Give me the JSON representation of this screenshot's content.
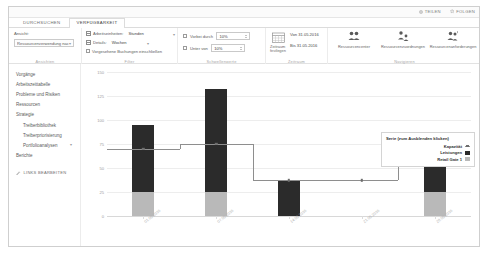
{
  "top_bar": {
    "actions": [
      {
        "label": "TEILEN",
        "icon": "share-icon"
      },
      {
        "label": "FOLGEN",
        "icon": "star-icon"
      }
    ]
  },
  "ribbon": {
    "tabs": [
      {
        "label": "DURCHSUCHEN",
        "active": false
      },
      {
        "label": "VERFÜGBARKEIT",
        "active": true
      }
    ],
    "groups": {
      "ansichten": {
        "label": "Ansichten",
        "field_label": "Ansicht:",
        "view_value": "Ressourcenverwendung nac",
        "caret": "▾"
      },
      "filter": {
        "label": "Filter",
        "rows": [
          {
            "icon": "units-grid-icon",
            "label": "Arbeitseinheiten:",
            "value": "Stunden",
            "caret": "▾"
          },
          {
            "icon": "details-grid-icon",
            "label": "Details:",
            "value": "Wochen",
            "caret": "▾"
          },
          {
            "icon": "checkbox",
            "label": "Vorgesehene Buchungen einschließen",
            "value": "",
            "caret": ""
          }
        ]
      },
      "schwellenwerte": {
        "label": "Schwellenwerte",
        "rows": [
          {
            "checkbox": true,
            "label": "Vorbei durch",
            "value": "10%"
          },
          {
            "checkbox": true,
            "label": "Unter von",
            "value": "10%"
          }
        ]
      },
      "zeitraum": {
        "label": "Zeitraum",
        "button_label": "Zeitraum festlegen",
        "date_from": "Von 31.05.2016",
        "date_to": "Bis 31.05.2016",
        "icon": "calendar-icon"
      },
      "navigieren": {
        "label": "Navigieren",
        "buttons": [
          {
            "label": "Ressourcencenter",
            "icon": "people-icon"
          },
          {
            "label": "Ressourcenzuordnungen",
            "icon": "people-assign-icon"
          },
          {
            "label": "Ressourcenanforderungen",
            "icon": "people-request-icon"
          }
        ]
      }
    }
  },
  "sidebar": {
    "items": [
      {
        "label": "Vorgänge",
        "sub": false,
        "caret": ""
      },
      {
        "label": "Arbeitszeittabelle",
        "sub": false,
        "caret": ""
      },
      {
        "label": "Probleme und Risiken",
        "sub": false,
        "caret": ""
      },
      {
        "label": "Ressourcen",
        "sub": false,
        "caret": ""
      },
      {
        "label": "Strategie",
        "sub": false,
        "caret": ""
      },
      {
        "label": "Treiberbibliothek",
        "sub": true,
        "caret": ""
      },
      {
        "label": "Treiberpriorisierung",
        "sub": true,
        "caret": ""
      },
      {
        "label": "Portfolioanalysen",
        "sub": true,
        "caret": "▾"
      },
      {
        "label": "Berichte",
        "sub": false,
        "caret": ""
      }
    ],
    "edit_links": {
      "label": "LINKS BEARBEITEN",
      "icon": "pencil-icon"
    }
  },
  "legend": {
    "title": "Serie (zum Ausblenden klicken)",
    "entries": [
      {
        "label": "Kapazität",
        "type": "line",
        "color": "#8e8e8e"
      },
      {
        "label": "Leistungen",
        "type": "area",
        "color": "#2b2b2b"
      },
      {
        "label": "Retail Gate 1",
        "type": "area",
        "color": "#b9b9b9"
      }
    ]
  },
  "chart_data": {
    "type": "bar",
    "stacked": true,
    "title": "",
    "xlabel": "",
    "ylabel": "",
    "ylim": [
      0,
      150
    ],
    "yticks": [
      0,
      25,
      50,
      75,
      100,
      125,
      150
    ],
    "grid": true,
    "legend_position": "right",
    "categories": [
      "01.05.2016",
      "07.05.2016",
      "14.05.2016",
      "21.05.2016",
      "28.05.2016"
    ],
    "series": [
      {
        "name": "Retail Gate 1",
        "type": "bar",
        "color": "#b9b9b9",
        "values": [
          25,
          25,
          0,
          0,
          25
        ]
      },
      {
        "name": "Leistungen",
        "type": "bar",
        "color": "#2b2b2b",
        "values": [
          70,
          107,
          37,
          0,
          27
        ]
      },
      {
        "name": "Kapazität",
        "type": "step-line",
        "color": "#8e8e8e",
        "values": [
          70,
          75,
          37,
          37,
          52
        ]
      }
    ]
  }
}
